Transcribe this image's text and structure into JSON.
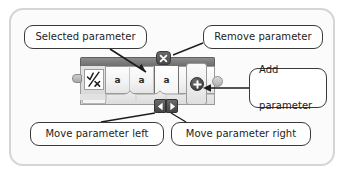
{
  "frame": {
    "name": "diagram-frame"
  },
  "callouts": [
    {
      "id": "selected",
      "label": "Selected parameter"
    },
    {
      "id": "remove",
      "label": "Remove parameter"
    },
    {
      "id": "add",
      "line1": "Add",
      "line2": "parameter"
    },
    {
      "id": "move_left",
      "label": "Move parameter left"
    },
    {
      "id": "move_right",
      "label": "Move parameter right"
    }
  ],
  "block": {
    "icon": "checkmark-cross-icon",
    "parameters": [
      {
        "label": "a",
        "selected": false
      },
      {
        "label": "a",
        "selected": false
      },
      {
        "label": "a",
        "selected": true
      },
      {
        "label": "a",
        "selected": false
      }
    ],
    "buttons": {
      "remove": {
        "icon": "close-x-icon",
        "glyph": "✕"
      },
      "move_left": {
        "icon": "triangle-left-icon",
        "glyph": "◀"
      },
      "move_right": {
        "icon": "triangle-right-icon",
        "glyph": "▶"
      },
      "add": {
        "icon": "plus-icon",
        "glyph": "＋"
      }
    }
  },
  "colors": {
    "frame_border": "#d5d5d5",
    "callout_border": "#3a3a3a",
    "block_topbar": "#7b7b7b",
    "block_body": "#f2f2f2",
    "button_dark": "#4a4a4a",
    "text": "#1d1d1d"
  }
}
